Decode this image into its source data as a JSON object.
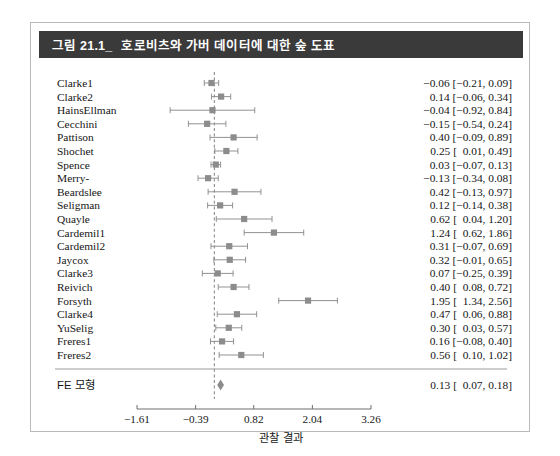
{
  "figure": {
    "caption_number": "그림 21.1_",
    "caption_title": "호로비츠와 가버 데이터에 대한 숲 도표"
  },
  "chart_data": {
    "type": "forest",
    "title": "호로비츠와 가버 데이터에 대한 숲 도표",
    "xlabel": "관찰 결과",
    "ylabel": "",
    "xlim": [
      -1.9,
      3.45
    ],
    "xticks": [
      -1.61,
      -0.39,
      0.82,
      2.04,
      3.26
    ],
    "xticklabels": [
      "−1.61",
      "−0.39",
      "0.82",
      "2.04",
      "3.26"
    ],
    "reference_line": 0.0,
    "grid": false,
    "legend": null,
    "marker_color": "#8c8c8c",
    "line_color": "#8c8c8c",
    "studies": [
      {
        "label": "Clarke1",
        "estimate": -0.06,
        "ci_low": -0.21,
        "ci_high": 0.09,
        "stat": "−0.06 [−0.21, 0.09]"
      },
      {
        "label": "Clarke2",
        "estimate": 0.14,
        "ci_low": -0.06,
        "ci_high": 0.34,
        "stat": "0.14 [−0.06, 0.34]"
      },
      {
        "label": "HainsEllman",
        "estimate": -0.04,
        "ci_low": -0.92,
        "ci_high": 0.84,
        "stat": "−0.04 [−0.92, 0.84]"
      },
      {
        "label": "Cecchini",
        "estimate": -0.15,
        "ci_low": -0.54,
        "ci_high": 0.24,
        "stat": "−0.15 [−0.54, 0.24]"
      },
      {
        "label": "Pattison",
        "estimate": 0.4,
        "ci_low": -0.09,
        "ci_high": 0.89,
        "stat": "0.40 [−0.09, 0.89]"
      },
      {
        "label": "Shochet",
        "estimate": 0.25,
        "ci_low": 0.01,
        "ci_high": 0.49,
        "stat": "0.25 [  0.01, 0.49]"
      },
      {
        "label": "Spence",
        "estimate": 0.03,
        "ci_low": -0.07,
        "ci_high": 0.13,
        "stat": "0.03 [−0.07, 0.13]"
      },
      {
        "label": "Merry-",
        "estimate": -0.13,
        "ci_low": -0.34,
        "ci_high": 0.08,
        "stat": "−0.13 [−0.34, 0.08]"
      },
      {
        "label": "Beardslee",
        "estimate": 0.42,
        "ci_low": -0.13,
        "ci_high": 0.97,
        "stat": "0.42 [−0.13, 0.97]"
      },
      {
        "label": "Seligman",
        "estimate": 0.12,
        "ci_low": -0.14,
        "ci_high": 0.38,
        "stat": "0.12 [−0.14, 0.38]"
      },
      {
        "label": "Quayle",
        "estimate": 0.62,
        "ci_low": 0.04,
        "ci_high": 1.2,
        "stat": "0.62 [  0.04, 1.20]"
      },
      {
        "label": "Cardemil1",
        "estimate": 1.24,
        "ci_low": 0.62,
        "ci_high": 1.86,
        "stat": "1.24 [  0.62, 1.86]"
      },
      {
        "label": "Cardemil2",
        "estimate": 0.31,
        "ci_low": -0.07,
        "ci_high": 0.69,
        "stat": "0.31 [−0.07, 0.69]"
      },
      {
        "label": "Jaycox",
        "estimate": 0.32,
        "ci_low": -0.01,
        "ci_high": 0.65,
        "stat": "0.32 [−0.01, 0.65]"
      },
      {
        "label": "Clarke3",
        "estimate": 0.07,
        "ci_low": -0.25,
        "ci_high": 0.39,
        "stat": "0.07 [−0.25, 0.39]"
      },
      {
        "label": "Reivich",
        "estimate": 0.4,
        "ci_low": 0.08,
        "ci_high": 0.72,
        "stat": "0.40 [  0.08, 0.72]"
      },
      {
        "label": "Forsyth",
        "estimate": 1.95,
        "ci_low": 1.34,
        "ci_high": 2.56,
        "stat": "1.95 [  1.34, 2.56]"
      },
      {
        "label": "Clarke4",
        "estimate": 0.47,
        "ci_low": 0.06,
        "ci_high": 0.88,
        "stat": "0.47 [  0.06, 0.88]"
      },
      {
        "label": "YuSelig",
        "estimate": 0.3,
        "ci_low": 0.03,
        "ci_high": 0.57,
        "stat": "0.30 [  0.03, 0.57]"
      },
      {
        "label": "Freres1",
        "estimate": 0.16,
        "ci_low": -0.08,
        "ci_high": 0.4,
        "stat": "0.16 [−0.08, 0.40]"
      },
      {
        "label": "Freres2",
        "estimate": 0.56,
        "ci_low": 0.1,
        "ci_high": 1.02,
        "stat": "0.56 [  0.10, 1.02]"
      }
    ],
    "summary": {
      "label": "FE 모형",
      "estimate": 0.13,
      "ci_low": 0.07,
      "ci_high": 0.18,
      "stat": "0.13 [  0.07, 0.18]"
    }
  }
}
